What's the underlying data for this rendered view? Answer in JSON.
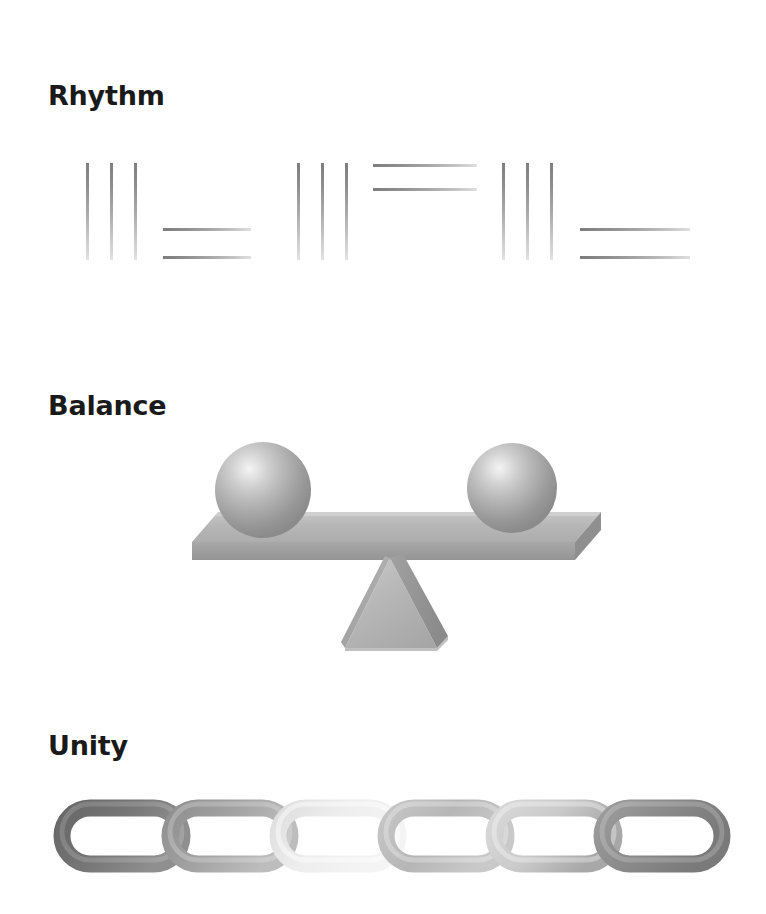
{
  "page": {
    "background": "#ffffff",
    "width": 766,
    "height": 914
  },
  "sections": [
    {
      "id": "rhythm",
      "title": "Rhythm",
      "figure": "repeating-line-pattern",
      "description": "Groups of three vertical bars alternating with pairs of horizontal lines",
      "colors": {
        "stroke_dark": "#7d7d7d",
        "stroke_light": "#e2e2e2"
      },
      "groups": [
        {
          "type": "vertical-bars",
          "count": 3,
          "x": [
            86,
            110,
            134
          ],
          "y": 23,
          "length": 97
        },
        {
          "type": "horizontal-lines",
          "count": 2,
          "x": 163,
          "width": 88,
          "y": [
            88,
            116
          ]
        },
        {
          "type": "vertical-bars",
          "count": 3,
          "x": [
            297,
            321,
            345
          ],
          "y": 23,
          "length": 97
        },
        {
          "type": "horizontal-lines",
          "count": 2,
          "x": 373,
          "width": 104,
          "y": [
            24,
            48
          ]
        },
        {
          "type": "vertical-bars",
          "count": 3,
          "x": [
            502,
            526,
            550
          ],
          "y": 23,
          "length": 97
        },
        {
          "type": "horizontal-lines",
          "count": 2,
          "x": 580,
          "width": 110,
          "y": [
            88,
            116
          ]
        }
      ]
    },
    {
      "id": "balance",
      "title": "Balance",
      "figure": "balance-scale",
      "description": "A level plank resting on a pyramid fulcrum with an identical sphere at each end",
      "colors": {
        "sphere_highlight": "#f2f2f2",
        "sphere_shadow": "#8a8a8a",
        "plank_top": "#b4b4b4",
        "plank_face": "#9b9b9b",
        "pyramid_front": "#b8b8b8",
        "pyramid_side": "#8f8f8f"
      },
      "elements": [
        {
          "name": "sphere-left",
          "cx": 263,
          "cy": 490,
          "r": 48
        },
        {
          "name": "sphere-right",
          "cx": 512,
          "cy": 488,
          "r": 45
        },
        {
          "name": "plank",
          "x": 190,
          "y": 515,
          "width": 385,
          "height": 45
        },
        {
          "name": "pyramid",
          "x": 340,
          "y": 558,
          "width": 100,
          "height": 90
        }
      ]
    },
    {
      "id": "unity",
      "title": "Unity",
      "figure": "chain",
      "description": "Six interlocking oval chain links forming one continuous chain",
      "colors": {
        "link_darkest": "#6d6d6d",
        "link_lightest": "#f2f2f2"
      },
      "links": [
        {
          "index": 1,
          "x": 57,
          "width": 125,
          "tone": "#6f6f6f",
          "tone2": "#8d8d8d"
        },
        {
          "index": 2,
          "x": 165,
          "width": 125,
          "tone": "#9b9b9b",
          "tone2": "#b6b6b6"
        },
        {
          "index": 3,
          "x": 273,
          "width": 125,
          "tone": "#e8e8e8",
          "tone2": "#f5f5f5"
        },
        {
          "index": 4,
          "x": 381,
          "width": 125,
          "tone": "#b9b9b9",
          "tone2": "#cfcfcf"
        },
        {
          "index": 5,
          "x": 489,
          "width": 125,
          "tone": "#d6d6d6",
          "tone2": "#e6e6e6"
        },
        {
          "index": 6,
          "x": 597,
          "width": 125,
          "tone": "#8a8a8a",
          "tone2": "#a5a5a5"
        }
      ]
    }
  ]
}
